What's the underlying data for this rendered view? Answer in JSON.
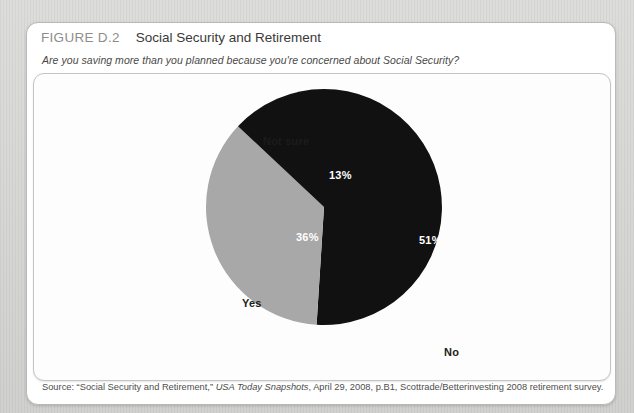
{
  "figure": {
    "number": "FIGURE D.2",
    "title": "Social Security and Retirement",
    "question": "Are you saving more than you planned because you're concerned about Social Security?"
  },
  "source": {
    "prefix": "Source: “Social Security and Retirement,” ",
    "publication": "USA Today Snapshots",
    "suffix": ", April 29, 2008, p.B1, Scottrade/Betterinvesting 2008 retirement survey.",
    "full": "Source: “Social Security and Retirement,” USA Today Snapshots, April 29, 2008, p.B1, Scottrade/Betterinvesting 2008 retirement survey."
  },
  "chart_data": {
    "type": "pie",
    "title": "Social Security and Retirement",
    "subtitle": "Are you saving more than you planned because you're concerned about Social Security?",
    "categories": [
      "No",
      "Yes",
      "Not sure"
    ],
    "values": [
      51,
      36,
      13
    ],
    "value_labels": [
      "51%",
      "36%",
      "13%"
    ],
    "colors": [
      "#111111",
      "#a8a8a8",
      "#111111"
    ],
    "legend": "none",
    "grid": false,
    "units": "percent",
    "slices": [
      {
        "label": "No",
        "value": 51,
        "value_label": "51%",
        "color": "#111111",
        "label_color": "#ffffff"
      },
      {
        "label": "Yes",
        "value": 36,
        "value_label": "36%",
        "color": "#a8a8a8",
        "label_color": "#ffffff"
      },
      {
        "label": "Not sure",
        "value": 13,
        "value_label": "13%",
        "color": "#111111",
        "label_color": "#ffffff"
      }
    ]
  }
}
